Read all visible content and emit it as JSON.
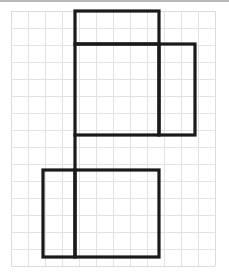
{
  "figure": {
    "background_color": "#ffffff",
    "stroke_color": "#1a1a1a",
    "stroke_width": 3.2,
    "grid": {
      "color": "#e3e3e6",
      "cell_size": 17,
      "origin_x": 11,
      "origin_y": 11,
      "columns": 12,
      "rows": 15,
      "right_edge": 215,
      "bottom_edge": 266
    },
    "rectangles": [
      {
        "name": "top-face",
        "x1": 75,
        "y1": 11,
        "x2": 159,
        "y2": 44,
        "cells_wide": 5,
        "cells_tall": 2
      },
      {
        "name": "front-face",
        "x1": 75,
        "y1": 44,
        "x2": 159,
        "y2": 135,
        "cells_wide": 5,
        "cells_tall": 5
      },
      {
        "name": "right-face",
        "x1": 159,
        "y1": 44,
        "x2": 195,
        "y2": 135,
        "cells_wide": 2,
        "cells_tall": 5
      },
      {
        "name": "bottom-face",
        "x1": 75,
        "y1": 170,
        "x2": 159,
        "y2": 257,
        "cells_wide": 5,
        "cells_tall": 5
      },
      {
        "name": "left-face",
        "x1": 43,
        "y1": 170,
        "x2": 75,
        "y2": 257,
        "cells_wide": 2,
        "cells_tall": 5
      }
    ],
    "connector_segment": {
      "name": "connector",
      "x": 75,
      "y1": 135,
      "y2": 170
    },
    "outline_path": "M75,11 L159,11 L159,44 L195,44 L195,135 L159,135 L159,170 L159,257 L43,257 L43,170 L75,170 L75,135 Z",
    "inner_segments": [
      {
        "name": "segment-top-front-divider",
        "x1": 75,
        "y1": 44,
        "x2": 159,
        "y2": 44
      },
      {
        "name": "segment-front-bottom-divider",
        "x1": 75,
        "y1": 135,
        "x2": 159,
        "y2": 135
      },
      {
        "name": "segment-left-bottom-divider",
        "x1": 75,
        "y1": 170,
        "x2": 75,
        "y2": 257
      },
      {
        "name": "segment-right-face-left-edge",
        "x1": 159,
        "y1": 44,
        "x2": 159,
        "y2": 135
      },
      {
        "name": "segment-connector",
        "x1": 75,
        "y1": 135,
        "x2": 75,
        "y2": 170
      },
      {
        "name": "segment-bottom-top-edge",
        "x1": 43,
        "y1": 170,
        "x2": 159,
        "y2": 170
      }
    ]
  }
}
